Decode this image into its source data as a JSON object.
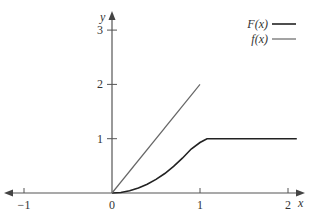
{
  "chart_data": {
    "type": "line",
    "title": "",
    "xlabel": "x",
    "ylabel": "y",
    "xlim": [
      -1.2,
      2.2
    ],
    "ylim": [
      0,
      3.3
    ],
    "grid": false,
    "legend_position": "top-right",
    "x_ticks": [
      {
        "value": -1,
        "label": "−1"
      },
      {
        "value": 0,
        "label": "0"
      },
      {
        "value": 1,
        "label": "1"
      },
      {
        "value": 2,
        "label": "2"
      }
    ],
    "y_ticks": [
      {
        "value": 1,
        "label": "1"
      },
      {
        "value": 2,
        "label": "2"
      },
      {
        "value": 3,
        "label": "3"
      }
    ],
    "series": [
      {
        "name": "F(x)",
        "style": "dark-thick",
        "color": "#222222",
        "x": [
          0,
          0.1,
          0.2,
          0.3,
          0.4,
          0.5,
          0.6,
          0.7,
          0.8,
          0.9,
          1.0,
          1.08,
          2.1
        ],
        "y": [
          0,
          0.01,
          0.04,
          0.09,
          0.16,
          0.25,
          0.36,
          0.49,
          0.64,
          0.81,
          0.93,
          1.0,
          1.0
        ]
      },
      {
        "name": "f(x)",
        "style": "gray-thin",
        "color": "#666666",
        "x": [
          0,
          1
        ],
        "y": [
          0,
          2
        ]
      }
    ]
  }
}
